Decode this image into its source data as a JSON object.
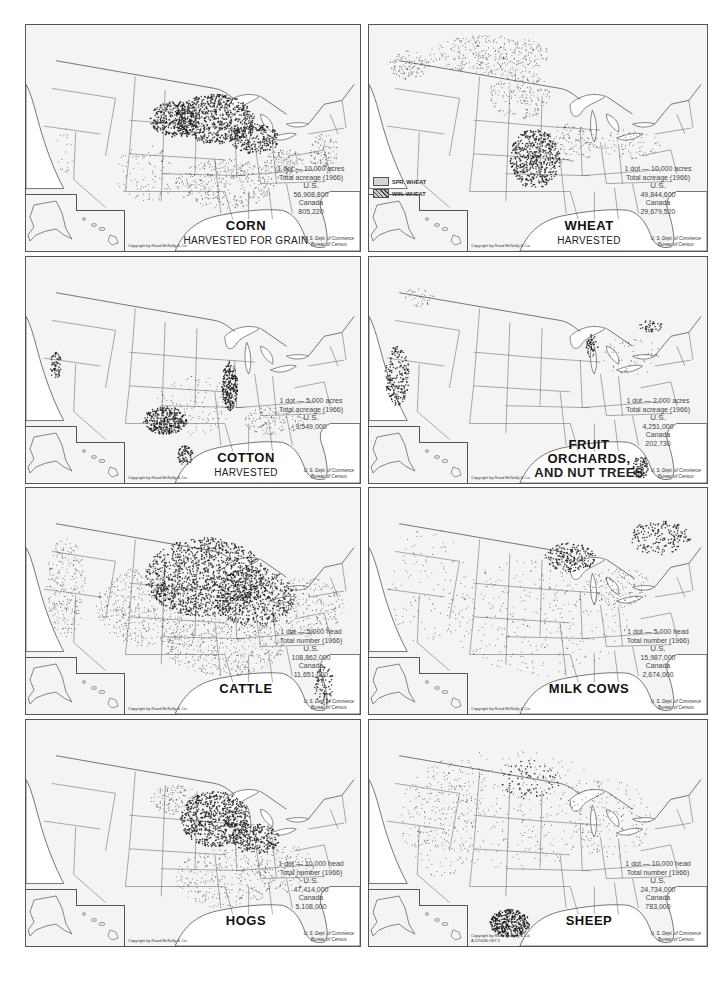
{
  "panels": [
    {
      "id": "corn",
      "title": "CORN",
      "subtitle": "HARVESTED FOR GRAIN",
      "legend": {
        "unit": "1 dot — 10,000 acres",
        "measure": "Total acreage (1966)",
        "us_label": "U.S.",
        "us_value": "56,908,800",
        "canada_label": "Canada",
        "canada_value": "805,220"
      },
      "copyright": "Copyright by Rand McNally & Co.",
      "source_line1": "U. S. Dept. of Commerce",
      "source_line2": "Bureau of Census"
    },
    {
      "id": "wheat",
      "title": "WHEAT",
      "subtitle": "HARVESTED",
      "key": {
        "spring": "SPR. WHEAT",
        "winter": "WIN. WHEAT"
      },
      "legend": {
        "unit": "1 dot — 10,000 acres",
        "measure": "Total acreage (1966)",
        "us_label": "U.S.",
        "us_value": "49,844,600",
        "canada_label": "Canada",
        "canada_value": "29,679,520"
      },
      "copyright": "Copyright by Rand McNally & Co.",
      "source_line1": "U. S. Dept. of Commerce",
      "source_line2": "Bureau of Census"
    },
    {
      "id": "cotton",
      "title": "COTTON",
      "subtitle": "HARVESTED",
      "legend": {
        "unit": "1 dot — 5,000 acres",
        "measure": "Total acreage (1966)",
        "us_label": "U.S.",
        "us_value": "9,549,000",
        "canada_label": "",
        "canada_value": ""
      },
      "copyright": "Copyright by Rand McNally & Co.",
      "source_line1": "U. S. Dept. of Commerce",
      "source_line2": "Bureau of Census"
    },
    {
      "id": "fruit",
      "title": "FRUIT ORCHARDS,",
      "subtitle": "AND NUT TREES",
      "legend": {
        "unit": "1 dot — 2,000 acres",
        "measure": "Total acreage (1966)",
        "us_label": "U.S.",
        "us_value": "4,251,000",
        "canada_label": "Canada",
        "canada_value": "202,730"
      },
      "copyright": "Copyright by Rand McNally & Co.",
      "source_line1": "U. S. Dept. of Commerce",
      "source_line2": "Bureau of Census"
    },
    {
      "id": "cattle",
      "title": "CATTLE",
      "subtitle": "",
      "legend": {
        "unit": "1 dot — 5,000 head",
        "measure": "Total number (1966)",
        "us_label": "U.S.",
        "us_value": "108,862,000",
        "canada_label": "Canada",
        "canada_value": "11,651,000"
      },
      "copyright": "Copyright by Rand McNally & Co.",
      "source_line1": "U. S. Dept. of Commerce",
      "source_line2": "Bureau of Census"
    },
    {
      "id": "milkcows",
      "title": "MILK COWS",
      "subtitle": "",
      "legend": {
        "unit": "1 dot — 5,000 head",
        "measure": "Total number (1966)",
        "us_label": "U.S.",
        "us_value": "15,987,000",
        "canada_label": "Canada",
        "canada_value": "2,674,000"
      },
      "copyright": "Copyright by Rand McNally & Co.",
      "source_line1": "U. S. Dept. of Commerce",
      "source_line2": "Bureau of Census"
    },
    {
      "id": "hogs",
      "title": "HOGS",
      "subtitle": "",
      "legend": {
        "unit": "1 dot — 10,000 head",
        "measure": "Total number (1966)",
        "us_label": "U.S.",
        "us_value": "47,414,000",
        "canada_label": "Canada",
        "canada_value": "5,108,000"
      },
      "copyright": "Copyright by Rand McNally & Co.",
      "source_line1": "U. S. Dept. of Commerce",
      "source_line2": "Bureau of Census"
    },
    {
      "id": "sheep",
      "title": "SHEEP",
      "subtitle": "",
      "legend": {
        "unit": "1 dot — 10,000 head",
        "measure": "Total number (1966)",
        "us_label": "U.S.",
        "us_value": "24,734,000",
        "canada_label": "Canada",
        "canada_value": "783,000"
      },
      "copyright": "Copyright by Rand McNally & Co.",
      "plate_id": "A-570580-967     3",
      "source_line1": "U. S. Dept. of Commerce",
      "source_line2": "Bureau of Census"
    }
  ],
  "colors": {
    "land": "#f4f4f4",
    "border": "#555555",
    "dots": "#1a1a1a",
    "water": "#ffffff"
  }
}
